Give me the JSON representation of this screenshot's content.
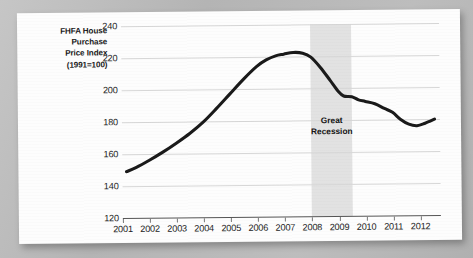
{
  "chart_data": {
    "type": "line",
    "title": "",
    "ylabel_lines": [
      "FHFA House",
      "Purchase",
      "Price Index",
      "(1991=100)"
    ],
    "ylabel": "FHFA House Purchase Price Index (1991=100)",
    "xlabel": "",
    "ylim": [
      120,
      240
    ],
    "yticks": [
      240,
      220,
      200,
      180,
      160,
      140,
      120
    ],
    "xlim": [
      2001,
      2012.75
    ],
    "xticks": [
      2001,
      2002,
      2003,
      2004,
      2005,
      2006,
      2007,
      2008,
      2009,
      2010,
      2011,
      2012
    ],
    "xtick_labels": [
      "2001",
      "2002",
      "2003",
      "2004",
      "2005",
      "2006",
      "2007",
      "2008",
      "2009",
      "2010",
      "2011",
      "2012"
    ],
    "grid": "horizontal",
    "legend": "none",
    "line_color": "#1a1a1a",
    "line_width": 3.1,
    "annotations": [
      {
        "type": "vspan",
        "label": "Great Recession",
        "label_lines": [
          "Great",
          "Recession"
        ],
        "x_start": 2008.0,
        "x_end": 2009.5,
        "color": "#e2e2e2",
        "label_y": 183
      }
    ],
    "series": [
      {
        "name": "FHFA House Purchase Price Index",
        "x": [
          2001.15,
          2001.5,
          2002.0,
          2002.5,
          2003.0,
          2003.5,
          2004.0,
          2004.5,
          2005.0,
          2005.5,
          2006.0,
          2006.35,
          2006.7,
          2007.0,
          2007.35,
          2007.7,
          2008.0,
          2008.35,
          2008.7,
          2009.0,
          2009.2,
          2009.5,
          2009.75,
          2010.0,
          2010.35,
          2010.7,
          2011.0,
          2011.3,
          2011.6,
          2011.9,
          2012.2,
          2012.55
        ],
        "y": [
          149.0,
          151.5,
          156.0,
          161.0,
          166.5,
          172.5,
          179.5,
          188.0,
          197.0,
          206.0,
          214.0,
          218.0,
          220.5,
          221.5,
          222.5,
          222.0,
          219.5,
          213.0,
          205.0,
          198.0,
          195.0,
          194.5,
          192.5,
          191.5,
          190.0,
          187.0,
          184.5,
          180.0,
          177.0,
          176.0,
          177.5,
          180.0
        ]
      }
    ]
  }
}
